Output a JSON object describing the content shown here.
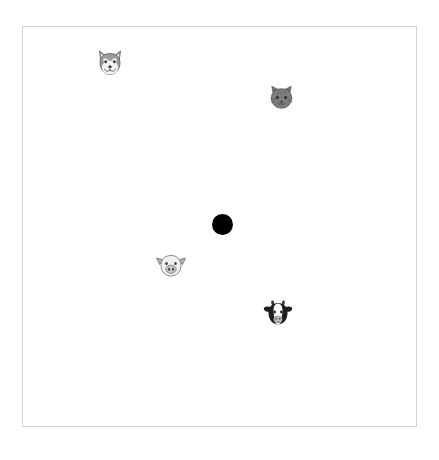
{
  "scene": {
    "title": "Animal faces scatter canvas",
    "canvas": {
      "width": 439,
      "height": 460,
      "background_color": "#ffffff"
    },
    "frame": {
      "name": "plot-frame",
      "x": 22,
      "y": 26,
      "width": 395,
      "height": 401,
      "border_color": "#d4d4d4",
      "border_width": 1
    },
    "markers": [
      {
        "id": "wolf",
        "icon_name": "wolf-face-icon",
        "label": "Wolf face",
        "glyph": "🐺",
        "x": 110,
        "y": 63,
        "size": 32,
        "color": "#8a8a8a"
      },
      {
        "id": "cat",
        "icon_name": "cat-face-icon",
        "label": "Cat face",
        "glyph": "🐱",
        "x": 281,
        "y": 97,
        "size": 31,
        "color": "#737373"
      },
      {
        "id": "pig",
        "icon_name": "pig-face-icon",
        "label": "Pig face",
        "glyph": "🐷",
        "x": 171,
        "y": 265,
        "size": 32,
        "color": "#9e9e9e"
      },
      {
        "id": "cow",
        "icon_name": "cow-face-icon",
        "label": "Cow face",
        "glyph": "🐮",
        "x": 278,
        "y": 313,
        "size": 32,
        "color": "#2b2b2b"
      }
    ],
    "center_dot": {
      "name": "center-dot",
      "label": "Black dot",
      "x": 222.5,
      "y": 224.5,
      "diameter": 21,
      "color": "#000000"
    }
  }
}
